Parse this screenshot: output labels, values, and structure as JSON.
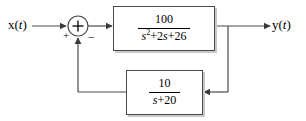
{
  "diagram": {
    "type": "control-system-block-diagram",
    "input_label": "x(t)",
    "output_label": "y(t)",
    "summing_junction": {
      "symbol": "+",
      "input_sign": "+",
      "feedback_sign": "−"
    },
    "forward_block": {
      "name": "forward-path-transfer-function",
      "numerator": "100",
      "denominator_prefix": "s",
      "denominator_exponent": "2",
      "denominator_suffix": "+2s+26",
      "expression": "100 / (s^2+2s+26)"
    },
    "feedback_block": {
      "name": "feedback-path-transfer-function",
      "numerator": "10",
      "denominator": "s+20",
      "expression": "10 / (s+20)"
    },
    "colors": {
      "line": "#4a4a4a",
      "text": "#000000",
      "shadow": "#c9c9c9",
      "background": "#ffffff"
    }
  }
}
